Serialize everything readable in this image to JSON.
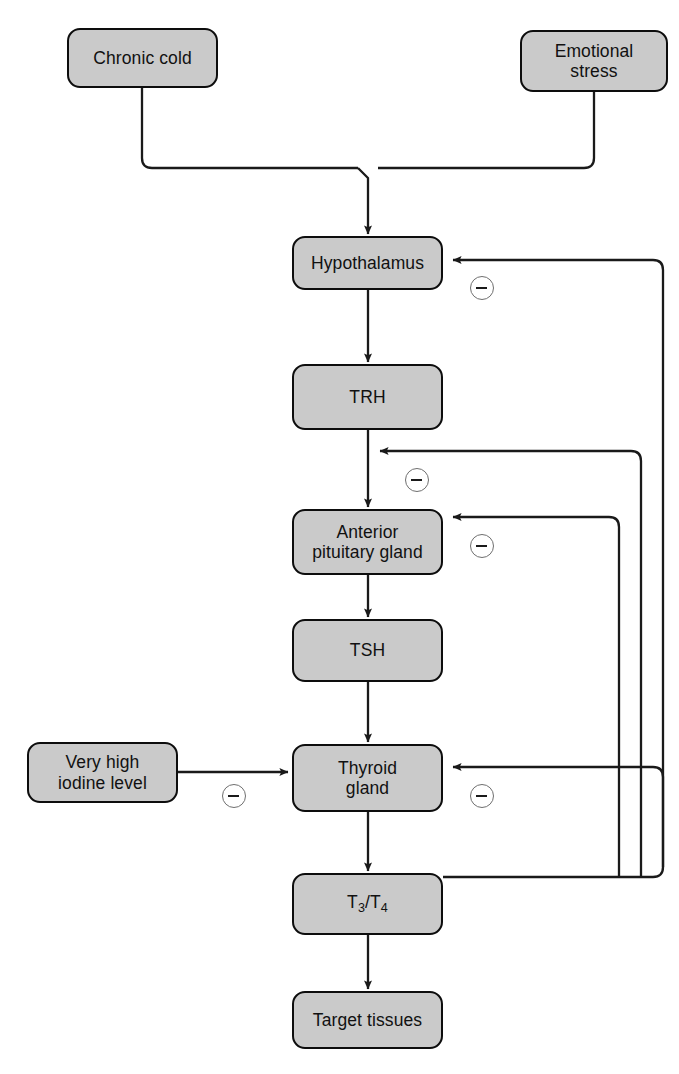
{
  "page": {
    "header_text": "",
    "page_number": "",
    "background_color": "#ffffff",
    "box_fill_color": "#cacaca",
    "box_stroke_color": "#0d0d0d",
    "line_color": "#1a1a1a",
    "badge_stroke_color": "#6f6f6f"
  },
  "nodes": {
    "chronic_cold": {
      "label": "Chronic cold"
    },
    "emotional_stress": {
      "label": "Emotional\nstress"
    },
    "hypothalamus": {
      "label": "Hypothalamus"
    },
    "trh": {
      "label": "TRH"
    },
    "anterior_pituitary": {
      "label": "Anterior\npituitary gland"
    },
    "tsh": {
      "label": "TSH"
    },
    "very_high_iodine": {
      "label": "Very high\niodine level"
    },
    "thyroid_gland": {
      "label": "Thyroid\ngland"
    },
    "t3_t4": {
      "label_prefix": "T",
      "sub1": "3",
      "slash": "/",
      "label_mid": "T",
      "sub2": "4",
      "plain": "T3/T4"
    },
    "target_tissues": {
      "label": "Target tissues"
    }
  },
  "badges": {
    "hypothalamus_inhibition": {
      "symbol": "−",
      "name": "minus"
    },
    "trh_pathway_inhibition": {
      "symbol": "−",
      "name": "minus"
    },
    "pituitary_inhibition": {
      "symbol": "−",
      "name": "minus"
    },
    "iodine_inhibition": {
      "symbol": "−",
      "name": "minus"
    },
    "thyroid_inhibition": {
      "symbol": "−",
      "name": "minus"
    }
  },
  "edges": [
    {
      "name": "chronic-cold-to-hypothalamus",
      "from": "chronic_cold",
      "to": "hypothalamus",
      "type": "stimulatory",
      "arrow": true
    },
    {
      "name": "emotional-stress-to-hypothalamus",
      "from": "emotional_stress",
      "to": "hypothalamus",
      "type": "stimulatory",
      "arrow": true
    },
    {
      "name": "hypothalamus-to-trh",
      "from": "hypothalamus",
      "to": "trh",
      "type": "stimulatory",
      "arrow": true
    },
    {
      "name": "trh-to-anterior-pituitary",
      "from": "trh",
      "to": "anterior_pituitary",
      "type": "stimulatory",
      "arrow": true
    },
    {
      "name": "anterior-pituitary-to-tsh",
      "from": "anterior_pituitary",
      "to": "tsh",
      "type": "stimulatory",
      "arrow": true
    },
    {
      "name": "tsh-to-thyroid-gland",
      "from": "tsh",
      "to": "thyroid_gland",
      "type": "stimulatory",
      "arrow": true
    },
    {
      "name": "thyroid-gland-to-t3-t4",
      "from": "thyroid_gland",
      "to": "t3_t4",
      "type": "stimulatory",
      "arrow": true
    },
    {
      "name": "t3-t4-to-target-tissues",
      "from": "t3_t4",
      "to": "target_tissues",
      "type": "stimulatory",
      "arrow": true
    },
    {
      "name": "iodine-to-thyroid-gland",
      "from": "very_high_iodine",
      "to": "thyroid_gland",
      "type": "inhibitory",
      "arrow": true,
      "badge": "iodine_inhibition"
    },
    {
      "name": "t3-t4-feedback-to-hypothalamus",
      "from": "t3_t4",
      "to": "hypothalamus",
      "type": "inhibitory",
      "arrow": true,
      "badge": "hypothalamus_inhibition"
    },
    {
      "name": "t3-t4-feedback-to-trh-pathway",
      "from": "t3_t4",
      "to": "trh_pathway",
      "type": "inhibitory",
      "arrow": true,
      "badge": "trh_pathway_inhibition"
    },
    {
      "name": "t3-t4-feedback-to-anterior-pituitary",
      "from": "t3_t4",
      "to": "anterior_pituitary",
      "type": "inhibitory",
      "arrow": true,
      "badge": "pituitary_inhibition"
    },
    {
      "name": "t3-t4-feedback-to-thyroid-gland",
      "from": "t3_t4",
      "to": "thyroid_gland",
      "type": "inhibitory",
      "arrow": true,
      "badge": "thyroid_inhibition"
    }
  ]
}
